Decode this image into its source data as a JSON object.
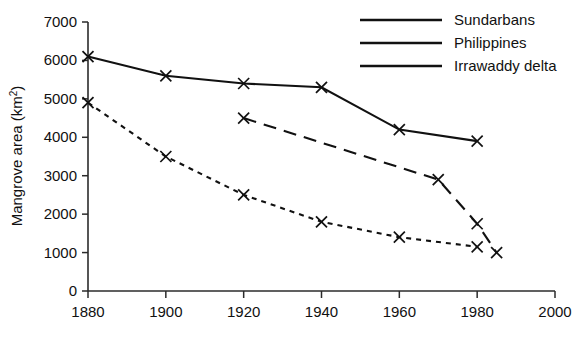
{
  "chart_data": {
    "type": "line",
    "title": "",
    "xlabel": "",
    "ylabel": "Mangrove area (km²)",
    "ylabel_main": "Mangrove area (km",
    "ylabel_sup": "2",
    "ylabel_close": ")",
    "xlim": [
      1880,
      2000
    ],
    "ylim": [
      0,
      7000
    ],
    "xticks": [
      1880,
      1900,
      1920,
      1940,
      1960,
      1980,
      2000
    ],
    "xtick_labels": [
      "1880",
      "1900",
      "1920",
      "1940",
      "1960",
      "1980",
      "2000"
    ],
    "yticks": [
      0,
      1000,
      2000,
      3000,
      4000,
      5000,
      6000,
      7000
    ],
    "ytick_labels": [
      "0",
      "1000",
      "2000",
      "3000",
      "4000",
      "5000",
      "6000",
      "7000"
    ],
    "grid": false,
    "legend_position": "top-right",
    "marker": "x",
    "series": [
      {
        "name": "Sundarbans",
        "style": "solid",
        "color": "#111111",
        "x": [
          1880,
          1900,
          1920,
          1940,
          1960,
          1980
        ],
        "values": [
          6100,
          5600,
          5400,
          5300,
          4200,
          3900
        ]
      },
      {
        "name": "Philippines",
        "style": "longdash",
        "color": "#111111",
        "x": [
          1920,
          1970,
          1980,
          1985
        ],
        "values": [
          4500,
          2900,
          1750,
          1000
        ]
      },
      {
        "name": "Irrawaddy delta",
        "style": "dotted",
        "color": "#111111",
        "x": [
          1880,
          1900,
          1920,
          1940,
          1960,
          1980
        ],
        "values": [
          4900,
          3500,
          2500,
          1800,
          1400,
          1150
        ]
      }
    ]
  },
  "legend": {
    "items": [
      {
        "label": "Sundarbans",
        "style": "solid"
      },
      {
        "label": "Philippines",
        "style": "longdash"
      },
      {
        "label": "Irrawaddy delta",
        "style": "dotted"
      }
    ]
  }
}
